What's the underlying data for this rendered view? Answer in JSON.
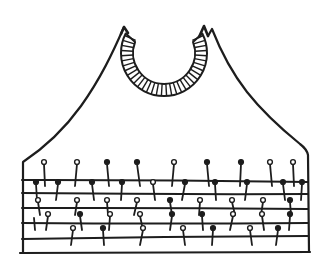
{
  "figure": {
    "type": "hand-drawn-illustration",
    "background_color": "#ffffff",
    "ink_color": "#1d1d1d"
  },
  "canvas": {
    "width": 330,
    "height": 276
  },
  "drawing": {
    "outline": {
      "stroke_width": 2.2,
      "paths": [
        "M124 27 C113 52 101 78 81 106 C63 131 41 150 23 162 L23 253",
        "M208 36 L212 29 C221 52 233 74 247 92 C262 111 284 131 300 144 C304 147 307 150 308 155 L309 252",
        "M20 253 L310 252"
      ]
    },
    "neckband": {
      "center": [
        164,
        53
      ],
      "outer_radius": 43,
      "inner_radius": 31,
      "band_path": "M125.7 33.5 A43 43 0 1 0 202.3 33.5 L193 41.9 A31 31 0 1 1 135.1 41.9 Z",
      "band_stroke_width": 2,
      "hatch": {
        "angle_start": -24,
        "angle_end": 204,
        "count": 34,
        "stroke_width": 1.4
      },
      "tips": [
        {
          "path": "M121 34 L124 27 L128 33",
          "stroke_width": 2.6
        },
        {
          "path": "M199 37 L204 26 L208 36",
          "stroke_width": 2.6
        }
      ]
    },
    "band_lines": {
      "stroke_width": 2,
      "lines": [
        {
          "x1": 22,
          "y1": 180,
          "x2": 308,
          "y2": 182,
          "wobble": -1.2
        },
        {
          "x1": 22,
          "y1": 193,
          "x2": 308,
          "y2": 194,
          "wobble": 1.0
        },
        {
          "x1": 22,
          "y1": 208,
          "x2": 308,
          "y2": 209,
          "wobble": -1.0
        },
        {
          "x1": 22,
          "y1": 223,
          "x2": 308,
          "y2": 223,
          "wobble": 1.2
        },
        {
          "x1": 22,
          "y1": 239,
          "x2": 308,
          "y2": 236,
          "wobble": -0.8
        }
      ]
    },
    "pins": {
      "stem_width": 1.8,
      "head_radius": 2.4,
      "rows": [
        {
          "head_y": 162,
          "tip_y": 186,
          "pins": [
            {
              "x": 44,
              "head": "o",
              "tilt": 1
            },
            {
              "x": 77,
              "head": "o",
              "tilt": -2
            },
            {
              "x": 107,
              "head": "f",
              "tilt": 2
            },
            {
              "x": 137,
              "head": "f",
              "tilt": 3
            },
            {
              "x": 174,
              "head": "o",
              "tilt": -2
            },
            {
              "x": 207,
              "head": "f",
              "tilt": 2
            },
            {
              "x": 241,
              "head": "f",
              "tilt": -1
            },
            {
              "x": 270,
              "head": "o",
              "tilt": 2
            },
            {
              "x": 293,
              "head": "o",
              "tilt": 1
            }
          ]
        },
        {
          "head_y": 182,
          "tip_y": 200,
          "pins": [
            {
              "x": 36,
              "head": "f",
              "tilt": 1
            },
            {
              "x": 58,
              "head": "f",
              "tilt": -2
            },
            {
              "x": 92,
              "head": "f",
              "tilt": 2
            },
            {
              "x": 122,
              "head": "f",
              "tilt": -1
            },
            {
              "x": 153,
              "head": "o",
              "tilt": 2
            },
            {
              "x": 185,
              "head": "f",
              "tilt": -3
            },
            {
              "x": 215,
              "head": "f",
              "tilt": 1
            },
            {
              "x": 247,
              "head": "f",
              "tilt": -2
            },
            {
              "x": 283,
              "head": "f",
              "tilt": 2
            },
            {
              "x": 302,
              "head": "f",
              "tilt": -1
            }
          ]
        },
        {
          "head_y": 200,
          "tip_y": 215,
          "pins": [
            {
              "x": 38,
              "head": "o",
              "tilt": 2
            },
            {
              "x": 77,
              "head": "o",
              "tilt": -2
            },
            {
              "x": 107,
              "head": "o",
              "tilt": 1
            },
            {
              "x": 137,
              "head": "o",
              "tilt": -3
            },
            {
              "x": 170,
              "head": "f",
              "tilt": 2
            },
            {
              "x": 200,
              "head": "o",
              "tilt": -1
            },
            {
              "x": 232,
              "head": "o",
              "tilt": 3
            },
            {
              "x": 263,
              "head": "o",
              "tilt": -2
            },
            {
              "x": 290,
              "head": "f",
              "tilt": 1
            }
          ]
        },
        {
          "head_y": 214,
          "tip_y": 230,
          "pins": [
            {
              "x": 34,
              "head": "n",
              "tilt": 1
            },
            {
              "x": 48,
              "head": "o",
              "tilt": -2
            },
            {
              "x": 80,
              "head": "f",
              "tilt": 2
            },
            {
              "x": 110,
              "head": "o",
              "tilt": -1
            },
            {
              "x": 140,
              "head": "o",
              "tilt": 3
            },
            {
              "x": 172,
              "head": "f",
              "tilt": -2
            },
            {
              "x": 202,
              "head": "f",
              "tilt": 1
            },
            {
              "x": 233,
              "head": "o",
              "tilt": -3
            },
            {
              "x": 262,
              "head": "o",
              "tilt": 2
            },
            {
              "x": 290,
              "head": "f",
              "tilt": -1
            }
          ]
        },
        {
          "head_y": 228,
          "tip_y": 245,
          "pins": [
            {
              "x": 73,
              "head": "o",
              "tilt": -2
            },
            {
              "x": 103,
              "head": "f",
              "tilt": 1
            },
            {
              "x": 143,
              "head": "o",
              "tilt": -3
            },
            {
              "x": 183,
              "head": "o",
              "tilt": 2
            },
            {
              "x": 213,
              "head": "f",
              "tilt": -1
            },
            {
              "x": 250,
              "head": "o",
              "tilt": 2
            },
            {
              "x": 278,
              "head": "f",
              "tilt": -2
            }
          ]
        }
      ]
    }
  }
}
